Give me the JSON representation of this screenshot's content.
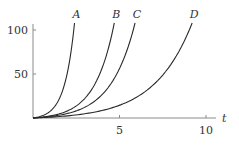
{
  "chart_data": {
    "type": "line",
    "title": "",
    "xlabel": "t",
    "ylabel": "",
    "xlim": [
      0,
      11
    ],
    "ylim": [
      0,
      110
    ],
    "x_ticks": [
      5,
      10
    ],
    "x_tick_labels": [
      "5",
      "10"
    ],
    "y_ticks": [
      50,
      100
    ],
    "y_tick_labels": [
      "50",
      "100"
    ],
    "grid": false,
    "legend": "inline labels at curve ends",
    "series": [
      {
        "name": "A",
        "t_end": 2.4,
        "x": [
          0,
          0.5,
          1.0,
          1.5,
          2.0,
          2.4
        ],
        "values": [
          0,
          3,
          9,
          23,
          55,
          108
        ]
      },
      {
        "name": "B",
        "t_end": 4.7,
        "x": [
          0,
          1,
          2,
          3,
          4,
          4.7
        ],
        "values": [
          0,
          3,
          10,
          25,
          60,
          108
        ]
      },
      {
        "name": "C",
        "t_end": 5.9,
        "x": [
          0,
          1,
          2,
          3,
          4,
          5,
          5.9
        ],
        "values": [
          0,
          2,
          6,
          14,
          30,
          60,
          108
        ]
      },
      {
        "name": "D",
        "t_end": 9.2,
        "x": [
          0,
          2,
          4,
          6,
          8,
          9.2
        ],
        "values": [
          0,
          3,
          9,
          23,
          58,
          108
        ]
      }
    ]
  }
}
